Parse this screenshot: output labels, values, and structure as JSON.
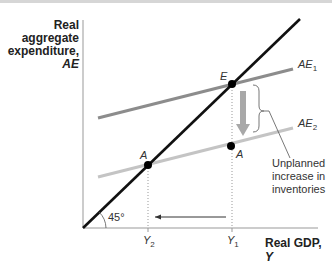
{
  "axes": {
    "y_label_lines": [
      "Real",
      "aggregate",
      "expenditure,"
    ],
    "y_label_var": "AE",
    "x_label": "Real GDP, ",
    "x_label_var": "Y",
    "angle_label": "45°"
  },
  "curves": {
    "ae1": "AE",
    "ae1_sub": "1",
    "ae2": "AE",
    "ae2_sub": "2"
  },
  "points": {
    "e": "E",
    "a_left": "A",
    "a_right": "A"
  },
  "ticks": {
    "y2": "Y",
    "y2_sub": "2",
    "y1": "Y",
    "y1_sub": "1"
  },
  "annotation": {
    "lines": [
      "Unplanned",
      "increase in",
      "inventories"
    ]
  },
  "colors": {
    "line_45": "#111111",
    "ae1": "#8c8c8c",
    "ae2": "#c4c4c4",
    "arrow": "#a8a8a8"
  }
}
